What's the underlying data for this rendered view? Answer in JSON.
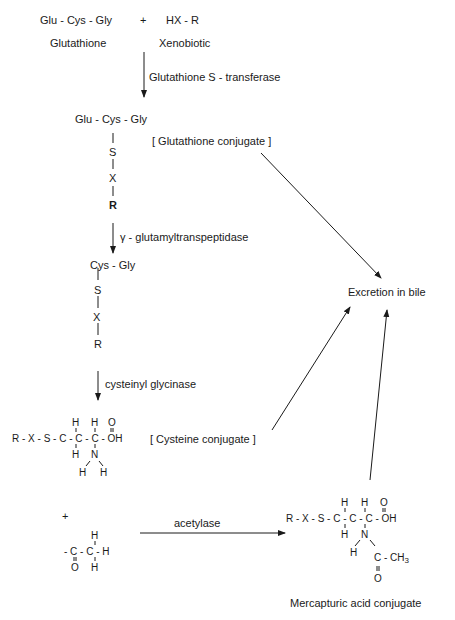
{
  "reaction": {
    "glutathione_formula": "Glu - Cys - Gly",
    "plus": "+",
    "xenobiotic_formula": "HX - R",
    "glutathione_label": "Glutathione",
    "xenobiotic_label": "Xenobiotic"
  },
  "enzymes": {
    "step1": "Glutathione S - transferase",
    "step2": "γ - glutamyltranspeptidase",
    "step3": "cysteinyl glycinase",
    "step4": "acetylase"
  },
  "glutathione_conjugate": {
    "top": "Glu - Cys - Gly",
    "bond": "|",
    "S": "S",
    "X": "X",
    "R": "R",
    "label": "[ Glutathione conjugate ]"
  },
  "cysgly_conjugate": {
    "top": "Cys - Gly",
    "bond": "|",
    "S": "S",
    "X": "X",
    "R": "R"
  },
  "cysteine_conjugate": {
    "top_row": "H   H   O",
    "main_row": "R - X - S - C - C - C - OH",
    "bottom_row": "H   N",
    "nh_row": "H   H",
    "label": "[ Cysteine conjugate ]"
  },
  "acetyl_group": {
    "plus": "+",
    "top": "H",
    "main": "- C - C - H",
    "bottom": "O   H"
  },
  "mercapturic": {
    "top_row": "H   H   O",
    "main_row": "R - X - S - C - C - C - OH",
    "n_row": "H   N",
    "acetyl_row_h": "H",
    "acetyl_row_c": "C - CH",
    "acetyl_sub": "3",
    "acetyl_o": "O",
    "label": "Mercapturic acid conjugate"
  },
  "destination": {
    "label": "Excretion in bile"
  }
}
